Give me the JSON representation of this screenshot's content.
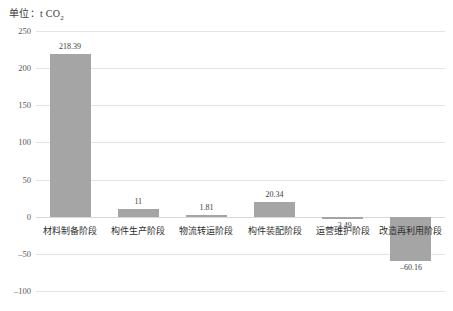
{
  "chart_data": {
    "type": "bar",
    "title": "单位：t CO2",
    "title_main": "单位：t CO",
    "title_sub": "2",
    "xlabel": "",
    "ylabel": "",
    "ylim": [
      -100,
      250
    ],
    "grid": true,
    "legend": "none",
    "categories": [
      "材料制备阶段",
      "构件生产阶段",
      "物流转运阶段",
      "构件装配阶段",
      "运营维护阶段",
      "改造再利用阶段"
    ],
    "values": [
      218.39,
      11,
      1.81,
      20.34,
      -3.49,
      -60.16
    ],
    "value_labels": [
      "218.39",
      "11",
      "1.81",
      "20.34",
      "-3.49",
      "-60.16"
    ],
    "yticks": [
      250,
      200,
      150,
      100,
      50,
      0,
      -50,
      -100
    ],
    "ytick_labels": [
      "250",
      "200",
      "150",
      "100",
      "50",
      "0",
      "-50",
      "-100"
    ],
    "bar_color": "#a5a5a5",
    "gridline_color": "#e4e4e4",
    "text_color": "#2e2e2e"
  }
}
